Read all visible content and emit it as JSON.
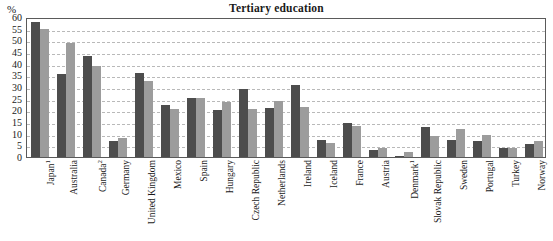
{
  "chart_data": {
    "type": "bar",
    "title": "Tertiary education",
    "xlabel": "",
    "ylabel": "%",
    "unit_label": "%",
    "ylim": [
      0,
      60
    ],
    "ytick_step": 5,
    "yticks": [
      60,
      55,
      50,
      45,
      40,
      35,
      30,
      25,
      20,
      15,
      10,
      5,
      0
    ],
    "grid": true,
    "legend": "none",
    "categories": [
      "Japan",
      "Australia",
      "Canada",
      "Germany",
      "United Kingdom",
      "Mexico",
      "Spain",
      "Hungary",
      "Czech Republic",
      "Netherlands",
      "Ireland",
      "Iceland",
      "France",
      "Austria",
      "Denmark",
      "Slovak Republic",
      "Sweden",
      "Portugal",
      "Turkey",
      "Norway"
    ],
    "category_labels": [
      "Japan¹",
      "Australia",
      "Canada²",
      "Germany",
      "United Kingdom",
      "Mexico",
      "Spain",
      "Hungary",
      "Czech Republic",
      "Netherlands",
      "Ireland",
      "Iceland",
      "France",
      "Austria",
      "Denmark¹",
      "Slovak Republic",
      "Sweden",
      "Portugal",
      "Turkey",
      "Norway"
    ],
    "footnote_markers": [
      "1",
      "2"
    ],
    "series": [
      {
        "name": "series-1",
        "color": "#4d4d4d",
        "values": [
          58.0,
          35.5,
          43.5,
          7.0,
          36.0,
          22.5,
          25.5,
          20.0,
          29.0,
          21.0,
          31.0,
          7.5,
          14.5,
          3.0,
          0.5,
          13.0,
          7.5,
          7.0,
          4.0,
          5.5
        ]
      },
      {
        "name": "series-2",
        "color": "#9c9c9c",
        "values": [
          55.0,
          49.0,
          39.0,
          8.0,
          32.5,
          20.5,
          25.5,
          23.5,
          20.5,
          24.0,
          21.5,
          6.0,
          13.5,
          4.0,
          2.0,
          9.0,
          12.0,
          9.5,
          4.0,
          7.0
        ]
      }
    ]
  }
}
